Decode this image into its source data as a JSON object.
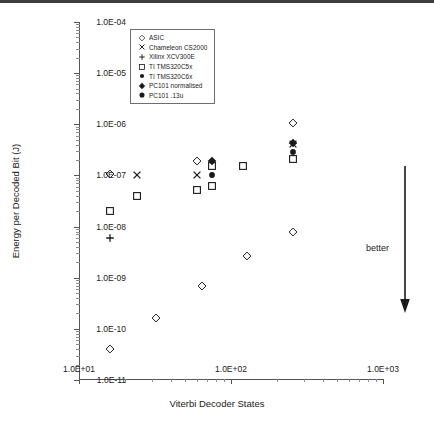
{
  "chart_data": {
    "type": "scatter",
    "title": "",
    "xlabel": "Viterbi Decoder States",
    "ylabel": "Energy per Decoded Bit (J)",
    "xscale": "log",
    "yscale": "log",
    "xlim": [
      10,
      1000
    ],
    "ylim": [
      1e-11,
      0.0001
    ],
    "grid": false,
    "legend_position": "top-center",
    "x_tick_labels": [
      "1.0E+01",
      "1.0E+02",
      "1.0E+03"
    ],
    "x_tick_values": [
      10,
      100,
      1000
    ],
    "y_tick_labels": [
      "1.0E-04",
      "1.0E-05",
      "1.0E-06",
      "1.0E-07",
      "1.0E-08",
      "1.0E-09",
      "1.0E-10",
      "1.0E-11"
    ],
    "y_tick_values": [
      0.0001,
      1e-05,
      1e-06,
      1e-07,
      1e-08,
      1e-09,
      1e-10,
      1e-11
    ],
    "annotations": [
      {
        "text": "better",
        "x": 480,
        "y": 3e-09,
        "kind": "arrow-label",
        "direction": "down"
      }
    ],
    "series": [
      {
        "name": "ASIC",
        "marker": "diamond-open",
        "points": [
          {
            "x": 16,
            "y": 4e-11
          },
          {
            "x": 32,
            "y": 1.6e-10
          },
          {
            "x": 64,
            "y": 7e-10
          },
          {
            "x": 128,
            "y": 2.6e-09
          },
          {
            "x": 256,
            "y": 8e-09
          },
          {
            "x": 16,
            "y": 1.05e-07
          },
          {
            "x": 60,
            "y": 1.9e-07
          },
          {
            "x": 256,
            "y": 1.05e-06
          }
        ]
      },
      {
        "name": "Chameleon CS2000",
        "marker": "cross-x",
        "points": [
          {
            "x": 24,
            "y": 1e-07
          },
          {
            "x": 60,
            "y": 1e-07
          },
          {
            "x": 256,
            "y": 4.2e-07
          }
        ]
      },
      {
        "name": "Xilinx XCV300E",
        "marker": "plus",
        "points": [
          {
            "x": 16,
            "y": 6e-09
          }
        ]
      },
      {
        "name": "TI TMS320C5x",
        "marker": "square-open",
        "points": [
          {
            "x": 16,
            "y": 2e-08
          },
          {
            "x": 24,
            "y": 4e-08
          },
          {
            "x": 60,
            "y": 5.3e-08
          },
          {
            "x": 75,
            "y": 6.2e-08
          },
          {
            "x": 75,
            "y": 1.5e-07
          },
          {
            "x": 120,
            "y": 1.5e-07
          },
          {
            "x": 256,
            "y": 2.1e-07
          }
        ]
      },
      {
        "name": "TI TMS320C6x",
        "marker": "circle-filled",
        "points": [
          {
            "x": 75,
            "y": 1e-07
          },
          {
            "x": 256,
            "y": 2.9e-07
          }
        ]
      },
      {
        "name": "PC101 normalised",
        "marker": "diamond-filled",
        "points": [
          {
            "x": 75,
            "y": 1.9e-07
          },
          {
            "x": 256,
            "y": 4.4e-07
          }
        ]
      },
      {
        "name": "PC101 .13u",
        "marker": "circle-large-filled",
        "points": []
      }
    ]
  },
  "legend": {
    "entries": [
      {
        "label": "ASIC",
        "marker": "diamond-open"
      },
      {
        "label": "Chameleon CS2000",
        "marker": "cross-x"
      },
      {
        "label": "Xilinx XCV300E",
        "marker": "plus"
      },
      {
        "label": "TI TMS320C5x",
        "marker": "square-open"
      },
      {
        "label": "TI TMS320C6x",
        "marker": "circle-filled"
      },
      {
        "label": "PC101 normalised",
        "marker": "diamond-filled"
      },
      {
        "label": "PC101  .13u",
        "marker": "circle-large-filled"
      }
    ]
  },
  "colors": {
    "marker": "#1a1a1a",
    "axis": "#555555",
    "minor_tick": "#8a8a8a",
    "text": "#1a1a1a",
    "background": "#ffffff"
  }
}
